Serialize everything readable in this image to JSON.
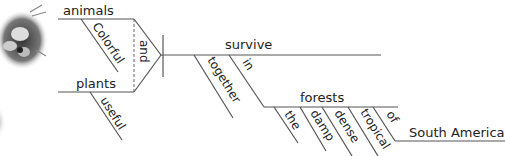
{
  "diagram": {
    "type": "sentence-diagram",
    "sentence_parts": {
      "subjects": [
        "animals",
        "plants"
      ],
      "conjunction": "and",
      "verb": "survive",
      "subject_modifiers": {
        "animals": "Colorful",
        "plants": "useful"
      },
      "verb_modifiers": [
        "together",
        "in"
      ],
      "object_of_preposition": "forests",
      "object_modifiers": [
        "the",
        "damp",
        "dense",
        "tropical",
        "of"
      ],
      "nested_object": "South America"
    },
    "labels": {
      "animals": "animals",
      "colorful": "Colorful",
      "and": "and",
      "plants": "plants",
      "useful": "useful",
      "survive": "survive",
      "together": "together",
      "in": "in",
      "forests": "forests",
      "the": "the",
      "damp": "damp",
      "dense": "dense",
      "tropical": "tropical",
      "of": "of",
      "south_america": "South America"
    },
    "decoration": "ladybug-image"
  }
}
